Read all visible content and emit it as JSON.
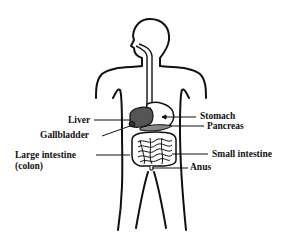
{
  "diagram": {
    "labels": {
      "liver": "Liver",
      "gallbladder": "Gallbladder",
      "large_intestine": "Large intestine",
      "colon": "(colon)",
      "stomach": "Stomach",
      "pancreas": "Pancreas",
      "small_intestine": "Small intestine",
      "anus": "Anus"
    },
    "colors": {
      "outline": "#111111",
      "liver_fill": "#555555",
      "pancreas_fill": "#888888",
      "background": "#ffffff"
    }
  }
}
